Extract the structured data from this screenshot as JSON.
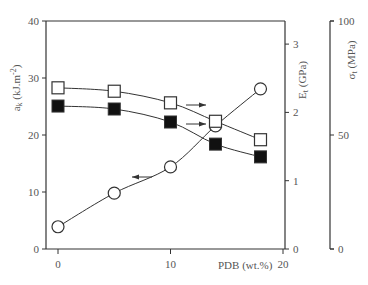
{
  "chart_data": {
    "type": "line",
    "title": "",
    "xlabel": "PDB (wt.%)",
    "x_ticks": [
      "0",
      "10",
      "20"
    ],
    "xlim": [
      0,
      20
    ],
    "x": [
      0,
      5,
      10,
      14,
      18
    ],
    "axes": [
      {
        "id": "left",
        "label": "a_k (kJ.m^-2)",
        "ticks": [
          "0",
          "10",
          "20",
          "30",
          "40"
        ],
        "ylim": [
          0,
          40
        ]
      },
      {
        "id": "right1",
        "label": "E_t (GPa)",
        "ticks": [
          "0",
          "1",
          "2",
          "3"
        ],
        "ylim": [
          0,
          3.6
        ]
      },
      {
        "id": "right2",
        "label": "σ_t (MPa)",
        "ticks": [
          "0",
          "50",
          "100"
        ],
        "ylim": [
          0,
          100
        ]
      }
    ],
    "series": [
      {
        "name": "a_k (impact strength)",
        "axis": "left",
        "marker": "open-circle",
        "values": [
          3.9,
          9.8,
          14.4,
          21.6,
          28.1
        ]
      },
      {
        "name": "E_t (tensile modulus)",
        "axis": "right1",
        "marker": "open-square",
        "values": [
          2.36,
          2.31,
          2.14,
          1.87,
          1.6
        ]
      },
      {
        "name": "σ_t (tensile strength)",
        "axis": "right2",
        "marker": "filled-square",
        "values": [
          62.7,
          61.4,
          55.7,
          46.0,
          40.4
        ]
      }
    ],
    "annotations": [
      {
        "type": "arrow",
        "direction": "left",
        "points_to": "a_k axis"
      },
      {
        "type": "arrow",
        "direction": "right",
        "points_to": "E_t axis"
      },
      {
        "type": "arrow",
        "direction": "right",
        "points_to": "σ_t axis"
      }
    ],
    "grid": false,
    "legend": "none"
  },
  "labels": {
    "xlabel": "PDB (wt.%)",
    "left_axis": "a",
    "left_axis_sub": "k",
    "left_axis_unit": " (kJ.m",
    "left_axis_sup": "-2",
    "left_axis_end": ")",
    "right1_axis": "E",
    "right1_axis_sub": "t",
    "right1_axis_unit": " (GPa)",
    "right2_axis": "σ",
    "right2_axis_sub": "t",
    "right2_axis_unit": " (MPa)"
  },
  "colors": {
    "line": "#333333",
    "text": "#555555",
    "marker_fill": "#111111"
  }
}
